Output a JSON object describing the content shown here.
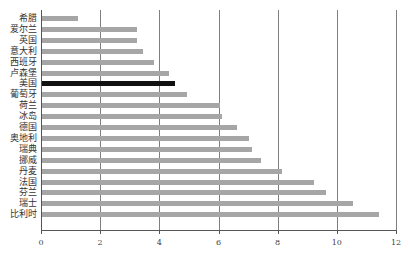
{
  "chart_data": {
    "type": "bar",
    "orientation": "horizontal",
    "title": "",
    "xlabel": "",
    "ylabel": "",
    "xlim": [
      0,
      12
    ],
    "xticks": [
      0,
      2,
      4,
      6,
      8,
      10,
      12
    ],
    "grid": "vertical",
    "highlight_color": "#111111",
    "bar_color": "#a6a6a6",
    "categories": [
      "希腊",
      "爱尔兰",
      "英国",
      "意大利",
      "西班牙",
      "卢森堡",
      "美国",
      "葡萄牙",
      "荷兰",
      "冰岛",
      "德国",
      "奥地利",
      "瑞典",
      "挪威",
      "丹麦",
      "法国",
      "芬兰",
      "瑞士",
      "比利时"
    ],
    "values": [
      1.2,
      3.2,
      3.2,
      3.4,
      3.8,
      4.3,
      4.5,
      4.9,
      6.0,
      6.1,
      6.6,
      7.0,
      7.1,
      7.4,
      8.1,
      9.2,
      9.6,
      10.5,
      11.4
    ],
    "highlighted": [
      "美国"
    ]
  }
}
